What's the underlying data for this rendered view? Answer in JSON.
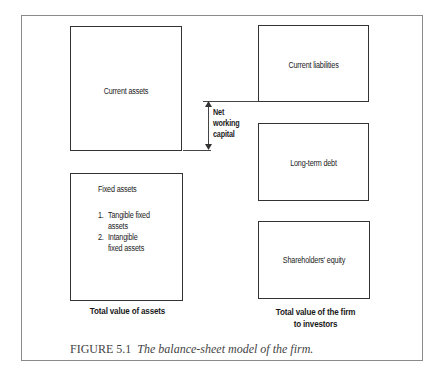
{
  "figure": {
    "caption_number": "FIGURE 5.1",
    "caption_text": "The balance-sheet model of the firm."
  },
  "left_side": {
    "current_assets": "Current assets",
    "fixed_assets": {
      "title": "Fixed assets",
      "items": [
        {
          "num": "1.",
          "line1": "Tangible fixed",
          "line2": "assets"
        },
        {
          "num": "2.",
          "line1": "Intangible",
          "line2": "fixed assets"
        }
      ]
    },
    "total_label": "Total value of assets"
  },
  "right_side": {
    "current_liabilities": "Current liabilities",
    "long_term_debt": "Long-term debt",
    "shareholders_equity": "Shareholders' equity",
    "total_label_line1": "Total value of the firm",
    "total_label_line2": "to investors"
  },
  "net_working_capital": {
    "line1": "Net",
    "line2": "working",
    "line3": "capital"
  }
}
